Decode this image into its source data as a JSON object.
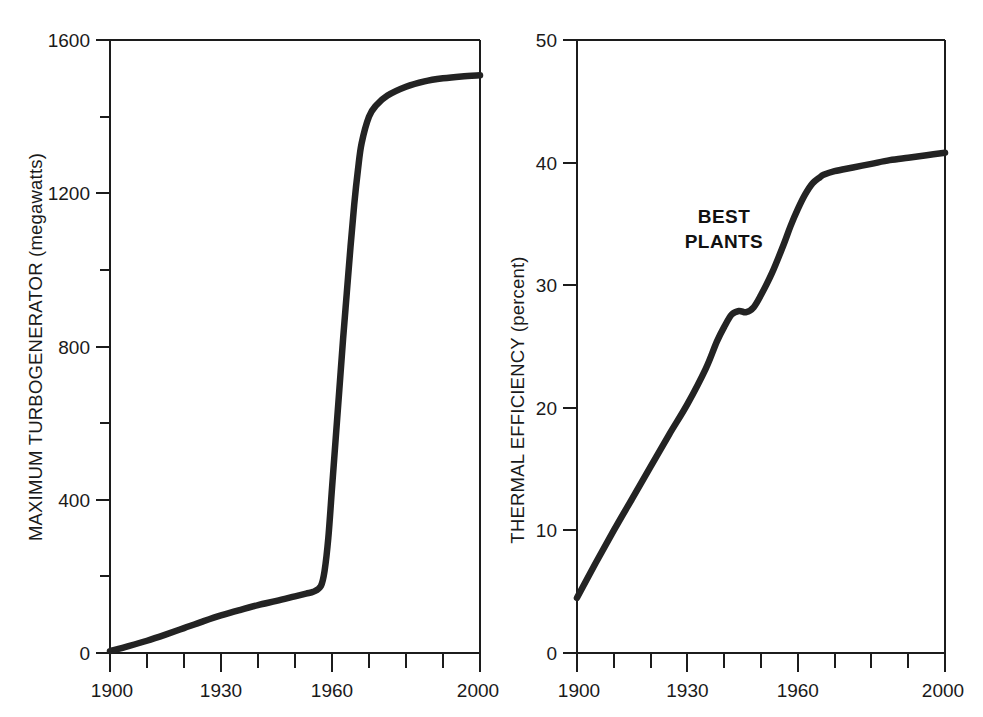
{
  "figure": {
    "background_color": "#ffffff",
    "curve_color": "#232323",
    "axis_color": "#1c1c1c"
  },
  "chart_data": [
    {
      "type": "line",
      "panel": "left",
      "title": "",
      "xlabel": "",
      "ylabel": "MAXIMUM TURBOGENERATOR (megawatts)",
      "xlim": [
        1900,
        2000
      ],
      "ylim": [
        0,
        1600
      ],
      "grid": false,
      "legend": "none",
      "x_ticks_major": [
        1900,
        1930,
        1960,
        2000
      ],
      "x_tick_labels": [
        "1900",
        "1930",
        "1960",
        "2000"
      ],
      "x_ticks_minor": [
        1910,
        1920,
        1940,
        1950,
        1970,
        1980,
        1990
      ],
      "y_ticks_major": [
        0,
        400,
        800,
        1200,
        1600
      ],
      "y_tick_labels": [
        "0",
        "400",
        "800",
        "1200",
        "1600"
      ],
      "y_ticks_minor": [
        200,
        600,
        1000,
        1400
      ],
      "x": [
        1900,
        1905,
        1910,
        1915,
        1920,
        1925,
        1930,
        1935,
        1940,
        1945,
        1950,
        1953,
        1955,
        1957,
        1958,
        1959,
        1960,
        1961,
        1962,
        1963,
        1964,
        1965,
        1966,
        1967,
        1968,
        1970,
        1972,
        1975,
        1980,
        1985,
        1990,
        1995,
        2000
      ],
      "values": [
        5,
        18,
        32,
        48,
        65,
        82,
        98,
        112,
        125,
        136,
        148,
        155,
        160,
        175,
        215,
        300,
        430,
        560,
        690,
        820,
        940,
        1060,
        1170,
        1260,
        1330,
        1400,
        1430,
        1455,
        1478,
        1492,
        1500,
        1505,
        1508
      ]
    },
    {
      "type": "line",
      "panel": "right",
      "title": "",
      "xlabel": "",
      "ylabel": "THERMAL EFFICIENCY (percent)",
      "annotation": "BEST\nPLANTS",
      "annotation_line1": "BEST",
      "annotation_line2": "PLANTS",
      "xlim": [
        1900,
        2000
      ],
      "ylim": [
        0,
        50
      ],
      "grid": false,
      "legend": "none",
      "x_ticks_major": [
        1900,
        1930,
        1960,
        2000
      ],
      "x_tick_labels": [
        "1900",
        "1930",
        "1960",
        "2000"
      ],
      "x_ticks_minor": [
        1910,
        1920,
        1940,
        1950,
        1970,
        1980,
        1990
      ],
      "y_ticks_major": [
        0,
        10,
        20,
        30,
        40,
        50
      ],
      "y_tick_labels": [
        "0",
        "10",
        "20",
        "30",
        "40",
        "50"
      ],
      "y_ticks_minor": [],
      "x": [
        1900,
        1905,
        1910,
        1915,
        1920,
        1925,
        1930,
        1935,
        1938,
        1940,
        1942,
        1944,
        1946,
        1948,
        1950,
        1953,
        1956,
        1958,
        1960,
        1962,
        1964,
        1966,
        1967,
        1970,
        1975,
        1980,
        1985,
        1990,
        1995,
        2000
      ],
      "values": [
        4.5,
        7.3,
        10.0,
        12.6,
        15.2,
        17.8,
        20.3,
        23.2,
        25.4,
        26.6,
        27.6,
        27.9,
        27.8,
        28.2,
        29.2,
        31.0,
        33.2,
        34.8,
        36.2,
        37.4,
        38.3,
        38.8,
        39.0,
        39.3,
        39.6,
        39.9,
        40.2,
        40.4,
        40.6,
        40.8
      ]
    }
  ]
}
